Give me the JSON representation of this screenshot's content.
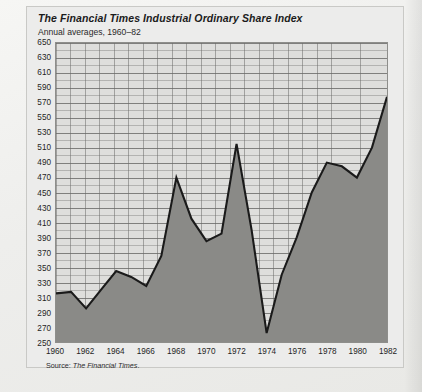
{
  "figure": {
    "title": "The Financial Times Industrial Ordinary Share Index",
    "subtitle": "Annual averages, 1960–82",
    "source": "Source: ",
    "source_em": "The Financial Times",
    "source_end": "."
  },
  "chart_data": {
    "type": "area",
    "title": "The Financial Times Industrial Ordinary Share Index",
    "subtitle": "Annual averages, 1960–82",
    "xlabel": "",
    "ylabel": "",
    "xlim": [
      1960,
      1982
    ],
    "ylim": [
      250,
      650
    ],
    "ytick_step": 20,
    "y_minor_step": 10,
    "grid": true,
    "legend": "none",
    "area_fill_color": "#8a8a87",
    "line_color": "#1a1a1a",
    "plot_bg_color": "#dededc",
    "x": [
      1960,
      1961,
      1962,
      1963,
      1964,
      1965,
      1966,
      1967,
      1968,
      1969,
      1970,
      1971,
      1972,
      1973,
      1974,
      1975,
      1976,
      1977,
      1978,
      1979,
      1980,
      1981,
      1982
    ],
    "values": [
      315,
      317,
      295,
      320,
      345,
      337,
      325,
      365,
      470,
      415,
      385,
      395,
      515,
      400,
      262,
      340,
      390,
      450,
      490,
      485,
      470,
      510,
      578
    ],
    "ytick_labels": [
      "650",
      "630",
      "610",
      "590",
      "570",
      "550",
      "530",
      "510",
      "490",
      "470",
      "450",
      "430",
      "410",
      "390",
      "370",
      "350",
      "330",
      "310",
      "290",
      "270",
      "250"
    ],
    "ytick_values": [
      650,
      630,
      610,
      590,
      570,
      550,
      530,
      510,
      490,
      470,
      450,
      430,
      410,
      390,
      370,
      350,
      330,
      310,
      290,
      270,
      250
    ],
    "xtick_labels": [
      "1960",
      "1962",
      "1964",
      "1966",
      "1968",
      "1970",
      "1972",
      "1974",
      "1976",
      "1978",
      "1980",
      "1982"
    ],
    "xtick_values": [
      1960,
      1962,
      1964,
      1966,
      1968,
      1970,
      1972,
      1974,
      1976,
      1978,
      1980,
      1982
    ]
  }
}
